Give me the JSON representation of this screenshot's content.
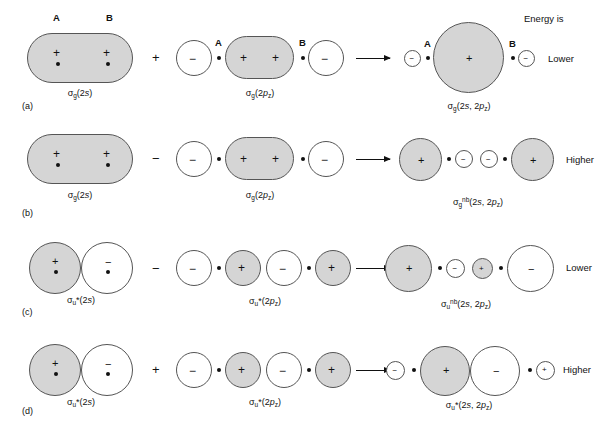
{
  "figure": {
    "title": "",
    "energy_header": "Energy is",
    "atom_labels": {
      "a": "A",
      "b": "B"
    },
    "row_tags": [
      "(a)",
      "(b)",
      "(c)",
      "(d)"
    ],
    "signs": {
      "plus": "+",
      "minus": "−"
    },
    "operators": {
      "plus": "+",
      "minus": "−"
    }
  },
  "rows": [
    {
      "tag": "(a)",
      "operator": "+",
      "energy": "Lower",
      "terms": [
        {
          "label_html": "σ<sub>g</sub>(2<i>s</i>)",
          "label_plain": "σg(2s)"
        },
        {
          "label_html": "σ<sub>g</sub>(2<i>p</i><sub>z</sub>)",
          "label_plain": "σg(2pz)"
        },
        {
          "label_html": "σ<sub>g</sub>(2<i>s</i>, 2<i>p</i><sub>z</sub>)",
          "label_plain": "σg(2s, 2pz)"
        }
      ]
    },
    {
      "tag": "(b)",
      "operator": "−",
      "energy": "Higher",
      "terms": [
        {
          "label_html": "σ<sub>g</sub>(2<i>s</i>)",
          "label_plain": "σg(2s)"
        },
        {
          "label_html": "σ<sub>g</sub>(2<i>p</i><sub>z</sub>)",
          "label_plain": "σg(2pz)"
        },
        {
          "label_html": "σ<sub>g</sub><sup>nb</sup>(2<i>s</i>, 2<i>p</i><sub>z</sub>)",
          "label_plain": "σg nb(2s, 2pz)"
        }
      ]
    },
    {
      "tag": "(c)",
      "operator": "−",
      "energy": "Lower",
      "terms": [
        {
          "label_html": "σ<sub>u</sub>*(2<i>s</i>)",
          "label_plain": "σu*(2s)"
        },
        {
          "label_html": "σ<sub>u</sub>*(2<i>p</i><sub>z</sub>)",
          "label_plain": "σu*(2pz)"
        },
        {
          "label_html": "σ<sub>u</sub><sup>nb</sup>(2<i>s</i>, 2<i>p</i><sub>z</sub>)",
          "label_plain": "σu nb(2s, 2pz)"
        }
      ]
    },
    {
      "tag": "(d)",
      "operator": "+",
      "energy": "Higher",
      "terms": [
        {
          "label_html": "σ<sub>u</sub>*(2<i>s</i>)",
          "label_plain": "σu*(2s)"
        },
        {
          "label_html": "σ<sub>u</sub>*(2<i>p</i><sub>z</sub>)",
          "label_plain": "σu*(2pz)"
        },
        {
          "label_html": "σ<sub>u</sub>*(2<i>s</i>, 2<i>p</i><sub>z</sub>)",
          "label_plain": "σu*(2s, 2pz)"
        }
      ]
    }
  ],
  "colors": {
    "shaded_lobe": "#d5d5d5",
    "blank_lobe": "#ffffff",
    "outline": "#555555",
    "ink": "#111111",
    "background": "#ffffff"
  },
  "chart_data": {
    "type": "diagram",
    "combinations": [
      {
        "row": "(a)",
        "operator": "+",
        "left": "σg(2s)",
        "right": "σg(2pz)",
        "result": "σg(2s, 2pz)",
        "energy": "Lower"
      },
      {
        "row": "(b)",
        "operator": "−",
        "left": "σg(2s)",
        "right": "σg(2pz)",
        "result": "σg nb(2s, 2pz)",
        "energy": "Higher"
      },
      {
        "row": "(c)",
        "operator": "−",
        "left": "σu*(2s)",
        "right": "σu*(2pz)",
        "result": "σu nb(2s, 2pz)",
        "energy": "Lower"
      },
      {
        "row": "(d)",
        "operator": "+",
        "left": "σu*(2s)",
        "right": "σu*(2pz)",
        "result": "σu*(2s, 2pz)",
        "energy": "Higher"
      }
    ]
  }
}
